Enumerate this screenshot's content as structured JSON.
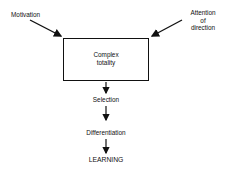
{
  "diagram": {
    "inputs": {
      "left": {
        "label": "Motivation"
      },
      "right": {
        "lines": [
          "Attention",
          "of",
          "direction"
        ]
      }
    },
    "box": {
      "lines": [
        "Complex",
        "totality"
      ]
    },
    "steps": [
      {
        "label": "Selection"
      },
      {
        "label": "Differentiation"
      },
      {
        "label": "LEARNING"
      }
    ],
    "colors": {
      "line": "#111111",
      "background": "#ffffff"
    }
  }
}
